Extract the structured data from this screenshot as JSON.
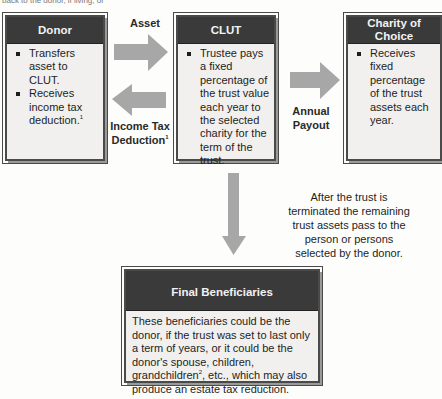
{
  "top_text": "back to the donor, if living, or",
  "donor": {
    "title": "Donor",
    "bullets": [
      {
        "text": "Transfers asset to CLUT.",
        "sup": ""
      },
      {
        "text": "Receives income tax deduction.",
        "sup": "1"
      }
    ]
  },
  "arrows": {
    "asset_label": "Asset",
    "income_tax_label_line1": "Income Tax",
    "income_tax_label_line2": "Deduction",
    "income_tax_sup": "1",
    "payout_label_line1": "Annual",
    "payout_label_line2": "Payout"
  },
  "clut": {
    "title": "CLUT",
    "bullets": [
      {
        "text": "Trustee pays a fixed percentage of the trust value each year to the selected charity for the term of the trust."
      }
    ]
  },
  "charity": {
    "title_line1": "Charity of",
    "title_line2": "Choice",
    "bullets": [
      {
        "text": "Receives fixed percentage of the trust assets each year."
      }
    ]
  },
  "termination_note": "After the trust is terminated the remaining trust assets pass to the person or persons selected by the donor.",
  "final": {
    "title": "Final Beneficiaries",
    "body_part1": "These beneficiaries could be the donor, if the trust was set to last only a term of years, or it could be the donor's spouse, children, grandchildren",
    "body_sup": "2",
    "body_part2": ", etc., which may also produce an estate tax reduction."
  },
  "colors": {
    "header_bg": "#3a3a3a",
    "box_bg": "#f1f0ee",
    "arrow": "#a7a7a7"
  }
}
